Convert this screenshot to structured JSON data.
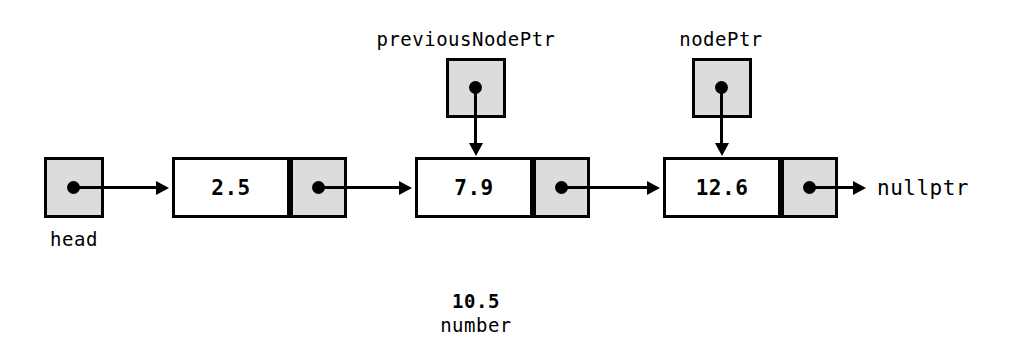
{
  "diagram": {
    "colors": {
      "pointer_fill": "#dcdcdc",
      "node_fill": "#ffffff",
      "stroke": "#000000"
    },
    "head": {
      "label": "head",
      "icon": "pointer-dot-icon"
    },
    "pointers": [
      {
        "name": "previousNodePtr",
        "label": "previousNodePtr",
        "points_to": "7.9"
      },
      {
        "name": "nodePtr",
        "label": "nodePtr",
        "points_to": "12.6"
      }
    ],
    "nodes": [
      {
        "value": "2.5",
        "next": "7.9"
      },
      {
        "value": "7.9",
        "next": "12.6"
      },
      {
        "value": "12.6",
        "next": "nullptr"
      }
    ],
    "terminator": {
      "label": "nullptr"
    },
    "new_value": {
      "value": "10.5",
      "label": "number"
    }
  }
}
